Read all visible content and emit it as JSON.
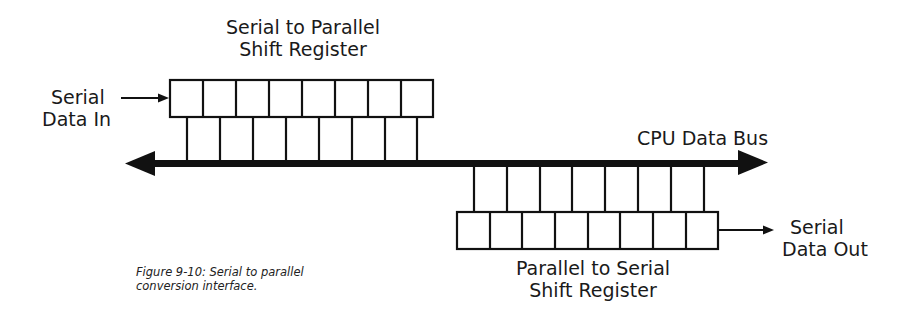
{
  "figure": {
    "top_register": {
      "title_line1": "Serial to Parallel",
      "title_line2": "Shift Register",
      "cells": 8
    },
    "bottom_register": {
      "title_line1": "Parallel to Serial",
      "title_line2": "Shift Register",
      "cells": 8
    },
    "input_label": {
      "line1": "Serial",
      "line2": "Data In"
    },
    "output_label": {
      "line1": "Serial",
      "line2": "Data Out"
    },
    "bus_label": "CPU Data Bus",
    "caption": {
      "line1": "Figure 9-10: Serial to parallel",
      "line2": "conversion interface."
    },
    "colors": {
      "stroke": "#111111",
      "background": "#ffffff"
    }
  }
}
